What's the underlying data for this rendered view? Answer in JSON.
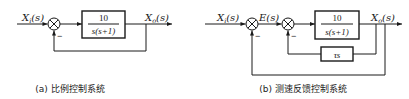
{
  "diagrams": {
    "a": {
      "input_label": "X",
      "input_sub": "i",
      "input_arg": "(s)",
      "output_label": "X",
      "output_sub": "o",
      "output_arg": "(s)",
      "plant_numerator": "10",
      "plant_denominator": "s(s+1)",
      "feedback_sign": "−",
      "caption": "(a) 比例控制系统"
    },
    "b": {
      "input_label": "X",
      "input_sub": "i",
      "input_arg": "(s)",
      "error_label": "E(s)",
      "output_label": "X",
      "output_sub": "o",
      "output_arg": "(s)",
      "plant_numerator": "10",
      "plant_denominator": "s(s+1)",
      "tach_block": "τs",
      "outer_feedback_sign": "−",
      "inner_feedback_sign": "−",
      "caption": "(b) 测速反馈控制系统"
    }
  },
  "colors": {
    "line": "#1a1a1a",
    "background": "#ffffff"
  }
}
